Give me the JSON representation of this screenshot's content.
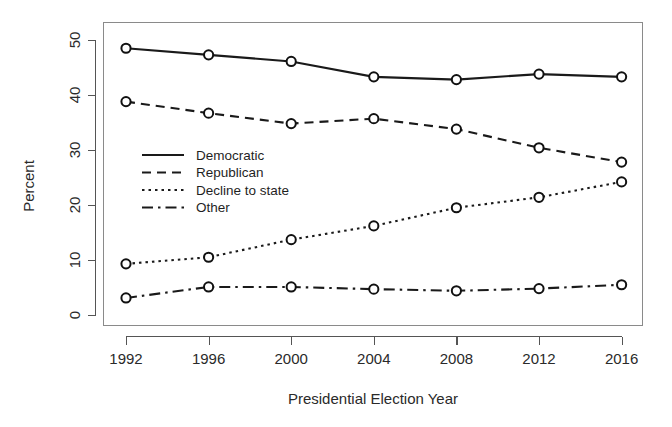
{
  "chart_data": {
    "type": "line",
    "title": "",
    "xlabel": "Presidential Election Year",
    "ylabel": "Percent",
    "categories": [
      "1992",
      "1996",
      "2000",
      "2004",
      "2008",
      "2012",
      "2016"
    ],
    "x": [
      1992,
      1996,
      2000,
      2004,
      2008,
      2012,
      2016
    ],
    "xlim": [
      1990.5,
      2017.5
    ],
    "ylim": [
      0,
      52
    ],
    "yticks": [
      0,
      10,
      20,
      30,
      40,
      50
    ],
    "ytick_labels": [
      "0",
      "10",
      "20",
      "30",
      "40",
      "50"
    ],
    "xticks": [
      1992,
      1996,
      2000,
      2004,
      2008,
      2012,
      2016
    ],
    "xtick_labels": [
      "1992",
      "1996",
      "2000",
      "2004",
      "2008",
      "2012",
      "2016"
    ],
    "grid": false,
    "legend_position": "center-left",
    "marker": "open-circle",
    "series": [
      {
        "name": "Democratic",
        "linestyle": "solid",
        "dasharray": "none",
        "color": "#1a1a1a",
        "values": [
          48.5,
          47.3,
          46.1,
          43.3,
          42.8,
          43.8,
          43.3
        ]
      },
      {
        "name": "Republican",
        "linestyle": "dashed",
        "dasharray": "9,6",
        "color": "#1a1a1a",
        "values": [
          38.8,
          36.7,
          34.8,
          35.7,
          33.8,
          30.4,
          27.8
        ]
      },
      {
        "name": "Decline to state",
        "linestyle": "dotted",
        "dasharray": "2.5,4",
        "color": "#1a1a1a",
        "values": [
          9.3,
          10.5,
          13.7,
          16.2,
          19.5,
          21.4,
          24.2
        ]
      },
      {
        "name": "Other",
        "linestyle": "dashdot",
        "dasharray": "11,5,2.5,5",
        "color": "#1a1a1a",
        "values": [
          3.1,
          5.1,
          5.1,
          4.7,
          4.4,
          4.8,
          5.5
        ]
      }
    ],
    "legend_entries": [
      {
        "label": "Democratic",
        "dasharray": "none"
      },
      {
        "label": "Republican",
        "dasharray": "9,6"
      },
      {
        "label": "Decline to state",
        "dasharray": "2.5,4"
      },
      {
        "label": "Other",
        "dasharray": "11,5,2.5,5"
      }
    ]
  },
  "figure": {
    "background": "#ffffff",
    "axis_color": "#555555",
    "frame_color": "#8a8a8a",
    "ink_color": "#1a1a1a"
  }
}
